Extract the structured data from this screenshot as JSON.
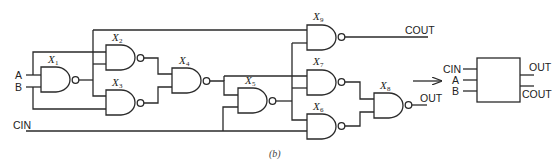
{
  "figure": {
    "caption": "(b)",
    "inputs": {
      "a": "A",
      "b": "B",
      "cin": "CIN"
    },
    "outputs": {
      "cout": "COUT",
      "out": "OUT"
    },
    "gates": [
      {
        "id": "X1",
        "letter": "X",
        "sub": "1",
        "type": "NAND"
      },
      {
        "id": "X2",
        "letter": "X",
        "sub": "2",
        "type": "NAND"
      },
      {
        "id": "X3",
        "letter": "X",
        "sub": "3",
        "type": "NAND"
      },
      {
        "id": "X4",
        "letter": "X",
        "sub": "4",
        "type": "NAND"
      },
      {
        "id": "X5",
        "letter": "X",
        "sub": "5",
        "type": "NAND"
      },
      {
        "id": "X6",
        "letter": "X",
        "sub": "6",
        "type": "NAND"
      },
      {
        "id": "X7",
        "letter": "X",
        "sub": "7",
        "type": "NAND"
      },
      {
        "id": "X8",
        "letter": "X",
        "sub": "8",
        "type": "NAND"
      },
      {
        "id": "X9",
        "letter": "X",
        "sub": "9",
        "type": "NAND"
      }
    ],
    "block": {
      "inputs": [
        "CIN",
        "A",
        "B"
      ],
      "outputs": [
        "OUT",
        "COUT"
      ]
    },
    "arrow": "right-arrow"
  }
}
